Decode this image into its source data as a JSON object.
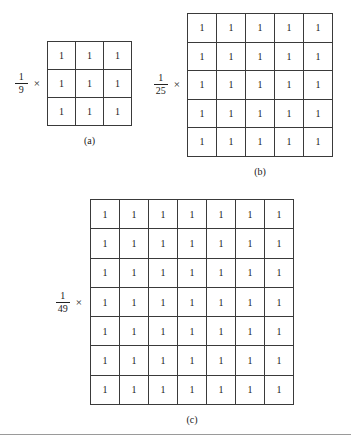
{
  "figure": {
    "multiply_symbol": "×",
    "panels": [
      {
        "id": "a",
        "caption": "(a)",
        "scalar": {
          "numerator": "1",
          "denominator": "9"
        },
        "grid": {
          "rows": 3,
          "cols": 7,
          "cell_value": "1"
        },
        "values": [
          [
            "1",
            "1",
            "1"
          ],
          [
            "1",
            "1",
            "1"
          ],
          [
            "1",
            "1",
            "1"
          ]
        ]
      },
      {
        "id": "b",
        "caption": "(b)",
        "scalar": {
          "numerator": "1",
          "denominator": "25"
        },
        "grid": {
          "rows": 5,
          "cols": 5,
          "cell_value": "1"
        },
        "values": [
          [
            "1",
            "1",
            "1",
            "1",
            "1"
          ],
          [
            "1",
            "1",
            "1",
            "1",
            "1"
          ],
          [
            "1",
            "1",
            "1",
            "1",
            "1"
          ],
          [
            "1",
            "1",
            "1",
            "1",
            "1"
          ],
          [
            "1",
            "1",
            "1",
            "1",
            "1"
          ]
        ]
      },
      {
        "id": "c",
        "caption": "(c)",
        "scalar": {
          "numerator": "1",
          "denominator": "49"
        },
        "grid": {
          "rows": 7,
          "cols": 7,
          "cell_value": "1"
        },
        "values": [
          [
            "1",
            "1",
            "1",
            "1",
            "1",
            "1",
            "1"
          ],
          [
            "1",
            "1",
            "1",
            "1",
            "1",
            "1",
            "1"
          ],
          [
            "1",
            "1",
            "1",
            "1",
            "1",
            "1",
            "1"
          ],
          [
            "1",
            "1",
            "1",
            "1",
            "1",
            "1",
            "1"
          ],
          [
            "1",
            "1",
            "1",
            "1",
            "1",
            "1",
            "1"
          ],
          [
            "1",
            "1",
            "1",
            "1",
            "1",
            "1",
            "1"
          ],
          [
            "1",
            "1",
            "1",
            "1",
            "1",
            "1",
            "1"
          ]
        ]
      }
    ]
  },
  "colors": {
    "page_background": "#ffffff",
    "ink": "#1b1b1b",
    "grid_line": "#3a3a3a",
    "rule": "#9a9a9a"
  }
}
